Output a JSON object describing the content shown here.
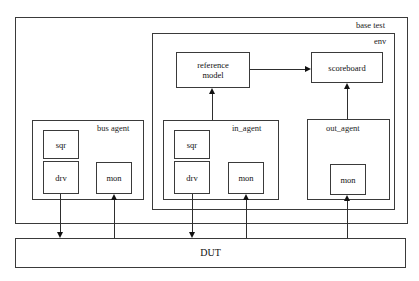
{
  "diagram": {
    "type": "block-diagram",
    "title_caption": "",
    "containers": [
      {
        "id": "base_test",
        "label": "base test",
        "label_align": "right"
      },
      {
        "id": "env",
        "label": "env",
        "label_align": "right"
      },
      {
        "id": "bus_agent",
        "label": "bus agent",
        "label_align": "right"
      },
      {
        "id": "in_agent",
        "label": "in_agent",
        "label_align": "right"
      },
      {
        "id": "out_agent",
        "label": "out_agent",
        "label_align": "center"
      }
    ],
    "nodes": [
      {
        "id": "reference_model",
        "label_line1": "reference",
        "label_line2": "model"
      },
      {
        "id": "scoreboard",
        "label": "scoreboard"
      },
      {
        "id": "bus_sqr",
        "label": "sqr"
      },
      {
        "id": "bus_drv",
        "label": "drv"
      },
      {
        "id": "bus_mon",
        "label": "mon"
      },
      {
        "id": "in_sqr",
        "label": "sqr"
      },
      {
        "id": "in_drv",
        "label": "drv"
      },
      {
        "id": "in_mon",
        "label": "mon"
      },
      {
        "id": "out_mon",
        "label": "mon"
      },
      {
        "id": "dut",
        "label": "DUT"
      }
    ],
    "connections": [
      {
        "from": "reference_model",
        "to": "scoreboard",
        "direction": "right"
      },
      {
        "from": "in_agent",
        "to": "reference_model",
        "direction": "up"
      },
      {
        "from": "out_mon",
        "to": "scoreboard",
        "direction": "up"
      },
      {
        "from": "bus_drv",
        "to": "dut",
        "direction": "down"
      },
      {
        "from": "dut",
        "to": "bus_mon",
        "direction": "up"
      },
      {
        "from": "in_drv",
        "to": "dut",
        "direction": "down"
      },
      {
        "from": "dut",
        "to": "in_mon",
        "direction": "up"
      },
      {
        "from": "dut",
        "to": "out_mon",
        "direction": "up"
      }
    ],
    "colors": {
      "line": "#3a3a3a",
      "arrow": "#111111",
      "text": "#111111",
      "background": "#ffffff"
    }
  }
}
